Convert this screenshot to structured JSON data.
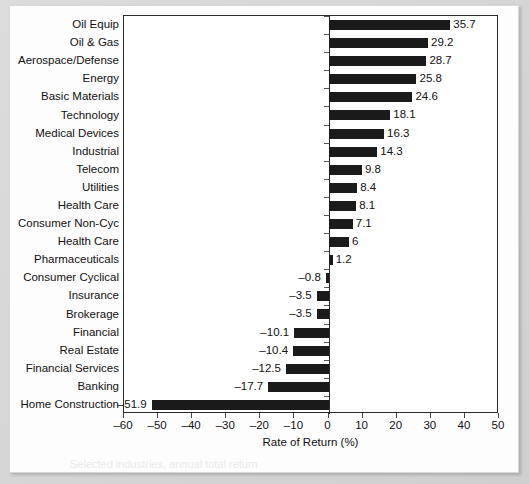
{
  "figure": {
    "axis_title": "Rate of Return (%)",
    "xticks": [
      "–60",
      "–50",
      "–40",
      "–30",
      "–20",
      "–10",
      "0",
      "10",
      "20",
      "30",
      "40",
      "50"
    ],
    "bar_color": "#1a1a1a",
    "frame_color": "#2a2a2a"
  },
  "ghost_lines": [
    {
      "text": "Industry rates of return",
      "x": 150,
      "y": 26,
      "size": 13
    },
    {
      "text": "comparative analysis across sectors",
      "x": 120,
      "y": 60,
      "size": 12
    },
    {
      "text": "Figure 5.2  Returns",
      "x": 290,
      "y": 250,
      "size": 15
    },
    {
      "text": "by industry group",
      "x": 300,
      "y": 272,
      "size": 14
    },
    {
      "text": "Sensitivity to the business",
      "x": 270,
      "y": 345,
      "size": 13
    },
    {
      "text": "cycle varies by sector",
      "x": 285,
      "y": 368,
      "size": 12
    },
    {
      "text": "Selected industries, annual total return",
      "x": 60,
      "y": 452,
      "size": 11
    }
  ],
  "chart_data": {
    "type": "bar",
    "orientation": "horizontal",
    "title": "",
    "xlabel": "Rate of Return (%)",
    "ylabel": "",
    "xlim": [
      -60,
      50
    ],
    "xticks": [
      -60,
      -50,
      -40,
      -30,
      -20,
      -10,
      0,
      10,
      20,
      30,
      40,
      50
    ],
    "grid": false,
    "legend": null,
    "categories": [
      "Oil Equip",
      "Oil & Gas",
      "Aerospace/Defense",
      "Energy",
      "Basic Materials",
      "Technology",
      "Medical Devices",
      "Industrial",
      "Telecom",
      "Utilities",
      "Health Care",
      "Consumer Non-Cyc",
      "Health Care",
      "Pharmaceuticals",
      "Consumer Cyclical",
      "Insurance",
      "Brokerage",
      "Financial",
      "Real Estate",
      "Financial Services",
      "Banking",
      "Home Construction"
    ],
    "values": [
      35.7,
      29.2,
      28.7,
      25.8,
      24.6,
      18.1,
      16.3,
      14.3,
      9.8,
      8.4,
      8.1,
      7.1,
      6,
      1.2,
      -0.8,
      -3.5,
      -3.5,
      -10.1,
      -10.4,
      -12.5,
      -17.7,
      -51.9
    ],
    "value_labels": [
      "35.7",
      "29.2",
      "28.7",
      "25.8",
      "24.6",
      "18.1",
      "16.3",
      "14.3",
      "9.8",
      "8.4",
      "8.1",
      "7.1",
      "6",
      "1.2",
      "–0.8",
      "–3.5",
      "–3.5",
      "–10.1",
      "–10.4",
      "–12.5",
      "–17.7",
      "–51.9"
    ]
  }
}
